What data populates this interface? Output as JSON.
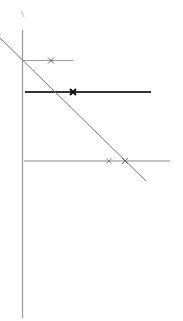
{
  "diagram": {
    "width": 183,
    "height": 321,
    "background": "#ffffff",
    "tick_mark": {
      "x1": 21,
      "y1": 11,
      "x2": 24,
      "y2": 17,
      "color": "#bbbbbb",
      "width": 1
    },
    "vertical_axis": {
      "x": 22.5,
      "y1": 30,
      "y2": 318,
      "color": "#999999",
      "width": 1.2
    },
    "diagonal_line": {
      "x1": 0,
      "y1": 38,
      "x2": 146,
      "y2": 181,
      "color": "#777777",
      "width": 1
    },
    "horizontal_lines": [
      {
        "name": "line-upper",
        "y": 60.5,
        "x1": 22,
        "x2": 73,
        "color": "#999999",
        "width": 1
      },
      {
        "name": "line-middle-bold",
        "y": 92,
        "x1": 25,
        "x2": 151,
        "color": "#333333",
        "width": 2.2
      },
      {
        "name": "line-lower",
        "y": 161,
        "x1": 24,
        "x2": 170,
        "color": "#888888",
        "width": 1
      }
    ],
    "markers": [
      {
        "name": "marker-upper",
        "x": 51,
        "y": 60.5,
        "size": 3,
        "color": "#666666",
        "width": 1
      },
      {
        "name": "marker-middle",
        "x": 73,
        "y": 92,
        "size": 3,
        "color": "#111111",
        "width": 2
      },
      {
        "name": "marker-lower-left",
        "x": 109,
        "y": 161,
        "size": 2.5,
        "color": "#888888",
        "width": 1
      },
      {
        "name": "marker-lower-right",
        "x": 125,
        "y": 161,
        "size": 3,
        "color": "#666666",
        "width": 1
      }
    ]
  }
}
